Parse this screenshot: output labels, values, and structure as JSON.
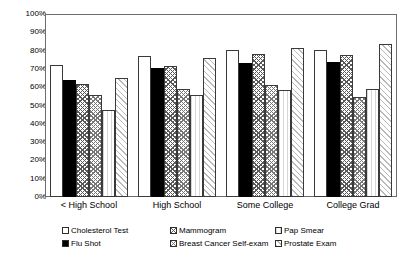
{
  "chart_data": {
    "type": "bar",
    "title": "",
    "xlabel": "",
    "ylabel": "",
    "ylim": [
      0,
      100
    ],
    "grid": false,
    "legend_position": "bottom",
    "categories": [
      "< High School",
      "High School",
      "Some College",
      "College Grad"
    ],
    "ytick_labels": [
      "100%",
      "90%",
      "80%",
      "70%",
      "60%",
      "50%",
      "40%",
      "30%",
      "20%",
      "10%",
      "0%"
    ],
    "ytick_values": [
      100,
      90,
      80,
      70,
      60,
      50,
      40,
      30,
      20,
      10,
      0
    ],
    "series": [
      {
        "name": "Cholesterol Test",
        "pattern": "solid-white",
        "values": [
          72.0,
          77.0,
          80.5,
          80.5
        ]
      },
      {
        "name": "Flu Shot",
        "pattern": "solid-black",
        "values": [
          64.0,
          70.5,
          73.5,
          74.0
        ]
      },
      {
        "name": "Mammogram",
        "pattern": "chevron-dark",
        "values": [
          62.0,
          71.5,
          78.0,
          77.5
        ]
      },
      {
        "name": "Breast Cancer Self-exam",
        "pattern": "chevron-mid",
        "values": [
          56.0,
          59.0,
          61.0,
          54.5
        ]
      },
      {
        "name": "Pap Smear",
        "pattern": "very-light",
        "values": [
          47.5,
          56.0,
          58.5,
          59.0
        ]
      },
      {
        "name": "Prostate Exam",
        "pattern": "diag-light",
        "values": [
          65.0,
          76.0,
          81.5,
          83.5
        ]
      }
    ]
  }
}
